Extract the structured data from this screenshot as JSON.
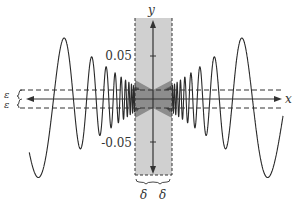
{
  "diagram": {
    "function": "y = x sin(1/x)",
    "axes": {
      "x_label": "x",
      "y_label": "y",
      "y_ticks": [
        {
          "value": 0.05,
          "label": "0.05"
        },
        {
          "value": -0.05,
          "label": "-0.05"
        }
      ]
    },
    "epsilon_label": "ε",
    "delta_label": "δ",
    "colors": {
      "curve": "#2a2a2a",
      "band": "#cfcfcf",
      "band_dark": "#8a8a8a",
      "axis": "#333333",
      "dashed": "#333333"
    }
  }
}
